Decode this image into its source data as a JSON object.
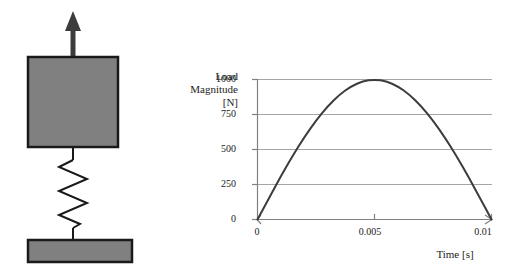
{
  "figure": {
    "background_color": "#ffffff"
  },
  "schematic": {
    "name": "mass-spring-schematic",
    "arrow": {
      "name": "upward-force-arrow",
      "direction": "up",
      "color": "#3c3c3c"
    },
    "mass_block": {
      "name": "mass-block",
      "fill_color": "#808080",
      "stroke_color": "#1a1a1a"
    },
    "spring": {
      "name": "spring",
      "coils": 6,
      "stroke_color": "#1a1a1a"
    },
    "base_block": {
      "name": "base-block",
      "fill_color": "#808080",
      "stroke_color": "#1a1a1a"
    }
  },
  "chart_data": {
    "type": "line",
    "title": "",
    "xlabel": "Time [s]",
    "ylabel": "Load Magnitude [N]",
    "ylabel_lines": [
      "Load",
      "Magnitude",
      "[N]"
    ],
    "xlim": [
      0,
      0.01
    ],
    "ylim": [
      0,
      1000
    ],
    "grid": "horizontal",
    "legend": "none",
    "line_color": "#3c3c3c",
    "gridline_color": "#a6a6a6",
    "axis_color": "#808080",
    "yticks": [
      0,
      250,
      500,
      750,
      1000
    ],
    "ytick_labels": [
      "0",
      "250",
      "500",
      "750",
      "1000"
    ],
    "xticks": [
      0,
      0.005,
      0.01
    ],
    "xtick_labels": [
      "0",
      "0.005",
      "0.01"
    ],
    "series": [
      {
        "name": "Load pulse",
        "formula": "1000 * sin(pi * t / 0.01)",
        "x": [
          0,
          0.0005,
          0.001,
          0.0015,
          0.002,
          0.0025,
          0.003,
          0.0035,
          0.004,
          0.0045,
          0.005,
          0.0055,
          0.006,
          0.0065,
          0.007,
          0.0075,
          0.008,
          0.0085,
          0.009,
          0.0095,
          0.01
        ],
        "values": [
          0,
          156,
          309,
          454,
          588,
          707,
          809,
          891,
          951,
          988,
          1000,
          988,
          951,
          891,
          809,
          707,
          588,
          454,
          309,
          156,
          0
        ]
      }
    ]
  }
}
